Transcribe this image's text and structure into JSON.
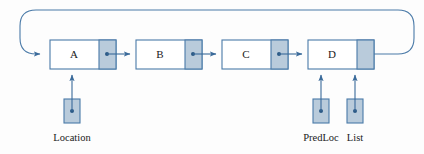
{
  "diagram": {
    "type": "linked-list",
    "background_color": "#fdfdfd",
    "colors": {
      "box_border": "#4a7aa8",
      "box_fill": "#ffffff",
      "pointer_cell_fill": "#b9cbdb",
      "arrow": "#3a6a9a",
      "loop_line": "#4a7aa8",
      "text": "#1a1a1a"
    },
    "nodes": [
      {
        "id": "node-a",
        "label": "A",
        "x": 50,
        "y": 40,
        "width": 66,
        "height": 29,
        "pointer_cell_width": 17
      },
      {
        "id": "node-b",
        "label": "B",
        "x": 136,
        "y": 40,
        "width": 66,
        "height": 29,
        "pointer_cell_width": 17
      },
      {
        "id": "node-c",
        "label": "C",
        "x": 222,
        "y": 40,
        "width": 66,
        "height": 29,
        "pointer_cell_width": 17
      },
      {
        "id": "node-d",
        "label": "D",
        "x": 308,
        "y": 40,
        "width": 66,
        "height": 29,
        "pointer_cell_width": 17
      }
    ],
    "links": [
      {
        "id": "link-a-b",
        "from": "node-a",
        "to": "node-b"
      },
      {
        "id": "link-b-c",
        "from": "node-b",
        "to": "node-c"
      },
      {
        "id": "link-c-d",
        "from": "node-c",
        "to": "node-d"
      },
      {
        "id": "link-d-a",
        "from": "node-d",
        "to": "node-a",
        "style": "wrap-around"
      }
    ],
    "variables": [
      {
        "id": "var-location",
        "label": "Location",
        "points_to": "node-a",
        "x": 64,
        "y": 99,
        "width": 16,
        "height": 24,
        "label_x": 72,
        "label_y": 141
      },
      {
        "id": "var-predloc",
        "label": "PredLoc",
        "points_to": "node-d",
        "x": 313,
        "y": 99,
        "width": 16,
        "height": 24,
        "label_x": 321,
        "label_y": 141
      },
      {
        "id": "var-list",
        "label": "List",
        "points_to": "node-d",
        "x": 347,
        "y": 99,
        "width": 16,
        "height": 24,
        "label_x": 355,
        "label_y": 141
      }
    ]
  }
}
